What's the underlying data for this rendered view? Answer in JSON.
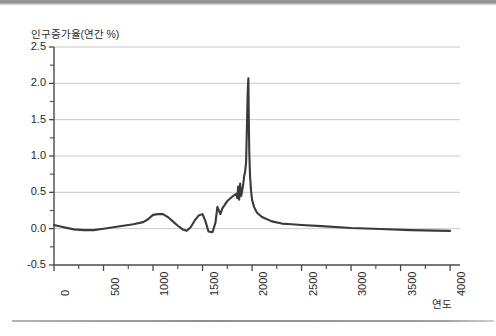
{
  "chart_data": {
    "type": "line",
    "title": "",
    "ylabel": "인구증가율(연간 %)",
    "xlabel": "연도",
    "xlim": [
      0,
      4100
    ],
    "ylim": [
      -0.5,
      2.5
    ],
    "grid": true,
    "legend": "none",
    "line_color": "#3a3a3a",
    "xticks": [
      "0",
      "500",
      "1000",
      "1500",
      "2000",
      "2500",
      "3000",
      "3500",
      "4000"
    ],
    "xtick_values": [
      0,
      500,
      1000,
      1500,
      2000,
      2500,
      3000,
      3500,
      4000
    ],
    "ytick_labels": [
      "-0.5",
      "0.0",
      "0.5",
      "1.0",
      "1.5",
      "2.0",
      "2.5"
    ],
    "ytick_values": [
      -0.5,
      0.0,
      0.5,
      1.0,
      1.5,
      2.0,
      2.5
    ],
    "yminor_values": [
      -0.25,
      0.25,
      0.75,
      1.25,
      1.75,
      2.25
    ],
    "series": [
      {
        "name": "인구증가율",
        "x": [
          0,
          100,
          200,
          300,
          400,
          500,
          600,
          700,
          800,
          900,
          950,
          1000,
          1050,
          1100,
          1150,
          1200,
          1250,
          1300,
          1340,
          1380,
          1420,
          1460,
          1500,
          1530,
          1560,
          1600,
          1630,
          1650,
          1680,
          1700,
          1750,
          1800,
          1820,
          1840,
          1850,
          1860,
          1870,
          1880,
          1890,
          1900,
          1910,
          1920,
          1930,
          1940,
          1950,
          1955,
          1960,
          1963,
          1968,
          1972,
          1980,
          1990,
          2000,
          2020,
          2050,
          2100,
          2200,
          2300,
          2400,
          2500,
          2700,
          3000,
          3300,
          3600,
          4000
        ],
        "y": [
          0.05,
          0.02,
          -0.01,
          -0.02,
          -0.02,
          0.0,
          0.02,
          0.04,
          0.06,
          0.09,
          0.13,
          0.19,
          0.2,
          0.2,
          0.16,
          0.1,
          0.04,
          -0.01,
          -0.03,
          0.02,
          0.11,
          0.18,
          0.2,
          0.1,
          -0.04,
          -0.05,
          0.08,
          0.3,
          0.2,
          0.28,
          0.38,
          0.44,
          0.46,
          0.48,
          0.42,
          0.58,
          0.4,
          0.62,
          0.45,
          0.52,
          0.6,
          0.72,
          0.78,
          0.92,
          1.5,
          1.82,
          2.0,
          2.07,
          1.42,
          1.05,
          0.72,
          0.52,
          0.4,
          0.3,
          0.22,
          0.16,
          0.1,
          0.07,
          0.06,
          0.05,
          0.035,
          0.01,
          -0.005,
          -0.02,
          -0.03
        ]
      }
    ],
    "annotations": [
      {
        "text": "peak",
        "x": 1963,
        "y": 2.07
      }
    ],
    "plot_area_px": {
      "left": 54,
      "right": 460,
      "top": 47,
      "bottom": 265
    }
  },
  "figure": {
    "background": "#ffffff",
    "grid_color": "#c9c9c9",
    "axis_color": "#4a4a4a",
    "text_color": "#1f1f1f"
  }
}
